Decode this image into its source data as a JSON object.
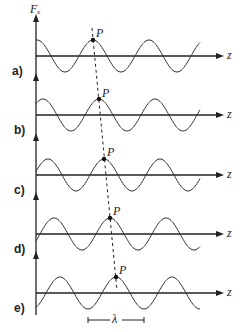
{
  "diagram": {
    "y_axis_label": "Fₓ",
    "x_axis_label": "z",
    "point_label": "P",
    "wavelength_label": "λ",
    "panels": [
      {
        "label": "a)",
        "axis_y": 56,
        "crest_x": 93
      },
      {
        "label": "b)",
        "axis_y": 115,
        "crest_x": 99
      },
      {
        "label": "c)",
        "axis_y": 175,
        "crest_x": 104
      },
      {
        "label": "d)",
        "axis_y": 234,
        "crest_x": 110
      },
      {
        "label": "e)",
        "axis_y": 293,
        "crest_x": 116
      }
    ],
    "amplitude": 16,
    "wavelength_px": 56
  }
}
